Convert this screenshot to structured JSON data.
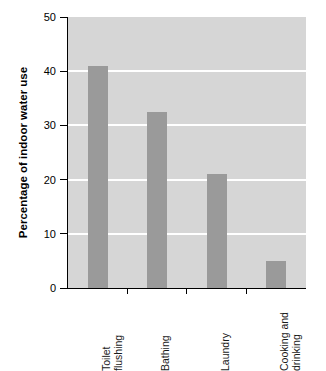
{
  "chart_data": {
    "type": "bar",
    "title": "",
    "subtitle": "",
    "xlabel": "",
    "ylabel": "Percentage of indoor water use",
    "categories": [
      "Toilet flushing",
      "Bathing",
      "Laundry",
      "Cooking and drinking"
    ],
    "values": [
      41,
      32.5,
      21,
      5
    ],
    "ylim": [
      0,
      50
    ],
    "yticks": [
      0,
      10,
      20,
      30,
      40,
      50
    ],
    "ytick_labels": [
      "0",
      "10",
      "20",
      "30",
      "40",
      "50"
    ],
    "gridlines": [
      10,
      20,
      30,
      40
    ],
    "grid": true,
    "legend": null,
    "legend_position": "none",
    "annotations": [],
    "colors": {
      "bar": "#9a9a9a",
      "plot_background": "#d6d6d6",
      "gridline": "#ffffff",
      "axis": "#000000",
      "figure_background": "#ffffff",
      "text": "#000000"
    }
  },
  "axis": {
    "y_title": "Percentage of indoor water use",
    "ticks": [
      {
        "label": "50",
        "value": 50
      },
      {
        "label": "40",
        "value": 40
      },
      {
        "label": "30",
        "value": 30
      },
      {
        "label": "20",
        "value": 20
      },
      {
        "label": "10",
        "value": 10
      },
      {
        "label": "0",
        "value": 0
      }
    ]
  },
  "bars": [
    {
      "label": "Toilet flushing",
      "label_display": "Toilet\nflushing",
      "value": 41
    },
    {
      "label": "Bathing",
      "label_display": "Bathing",
      "value": 32.5
    },
    {
      "label": "Laundry",
      "label_display": "Laundry",
      "value": 21
    },
    {
      "label": "Cooking and drinking",
      "label_display": "Cooking and\ndrinking",
      "value": 5
    }
  ]
}
